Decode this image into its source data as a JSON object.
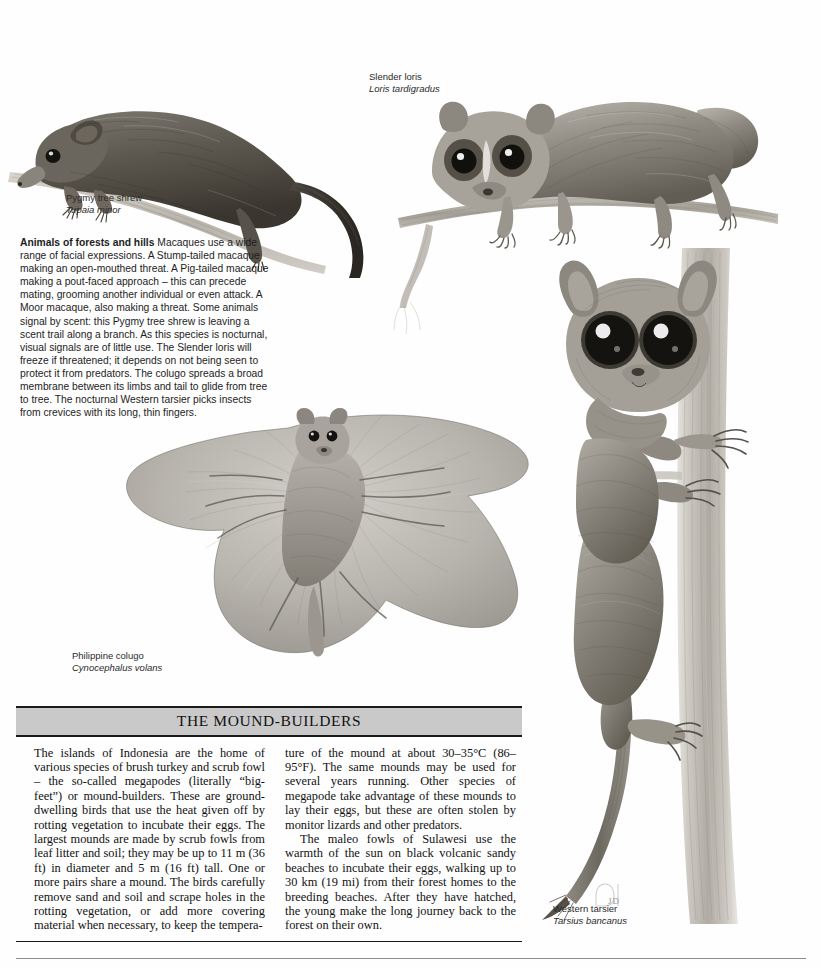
{
  "page": {
    "background_color": "#fefefe",
    "text_color": "#1d1d1d",
    "signature": "JD"
  },
  "body_text": {
    "lead_in": "Animals of forests and hills",
    "text": " Macaques use a wide range of facial expressions. A Stump-tailed macaque making an open-mouthed threat. A Pig-tailed macaque making a pout-faced approach – this can precede mating, grooming another individual or even attack. A Moor macaque, also making a threat. Some animals signal by scent: this Pygmy tree shrew is leaving a scent trail along a branch. As this species is nocturnal, visual signals are of little use. The Slender loris will freeze if threatened; it depends on not being seen to protect it from predators. The colugo spreads a broad membrane between its limbs and tail to glide from tree to tree. The nocturnal Western tarsier picks insects from crevices with its long, thin fingers."
  },
  "captions": [
    {
      "key": "pygmy-tree-shrew",
      "common": "Pygmy tree shrew",
      "latin": "Tupaia minor"
    },
    {
      "key": "slender-loris",
      "common": "Slender loris",
      "latin": "Loris tardigradus"
    },
    {
      "key": "philippine-colugo",
      "common": "Philippine colugo",
      "latin": "Cynocephalus volans"
    },
    {
      "key": "western-tarsier",
      "common": "Western tarsier",
      "latin": "Tarsius bancanus"
    }
  ],
  "feature_box": {
    "title": "THE MOUND-BUILDERS",
    "header_fill": "#c9c9c9",
    "left_column": [
      "The islands of Indonesia are the home of various species of brush turkey and scrub fowl – the so-called megapodes (literally “big-feet”) or mound-builders. These are ground-dwelling birds that use the heat given off by rotting vegetation to incubate their eggs. The largest mounds are made by scrub fowls from leaf litter and soil; they may be up to 11 m (36 ft) in diameter and 5 m (16 ft) tall. One or more pairs share a mound. The birds carefully remove sand and soil and scrape holes in the rotting vegetation, or add more covering material when necessary, to keep the tempera-"
    ],
    "right_column": [
      "ture of the mound at about 30–35°C (86–95°F). The same mounds may be used for several years running. Other species of megapode take advantage of these mounds to lay their eggs, but these are often stolen by monitor lizards and other predators.",
      "The maleo fowls of Sulawesi use the warmth of the sun on black volcanic sandy beaches to incubate their eggs, walking up to 30 km (19 mi) from their forest homes to the breeding beaches. After they have hatched, the young make the long journey back to the forest on their own."
    ]
  },
  "illustrations": [
    {
      "key": "pygmy-tree-shrew-illustration",
      "subject": "Pygmy tree shrew on a branch"
    },
    {
      "key": "slender-loris-illustration",
      "subject": "Slender loris clinging to a branch"
    },
    {
      "key": "philippine-colugo-illustration",
      "subject": "Philippine colugo gliding with spread membrane"
    },
    {
      "key": "western-tarsier-illustration",
      "subject": "Western tarsier clinging to a vertical tree trunk"
    }
  ]
}
